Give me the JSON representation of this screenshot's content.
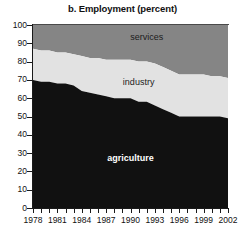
{
  "chart_data": {
    "type": "area",
    "title": "b. Employment (percent)",
    "xlabel": "",
    "ylabel": "",
    "ylim": [
      0,
      100
    ],
    "xlim": [
      1978,
      2002
    ],
    "grid": false,
    "legend_position": "inline-labels",
    "stacked": true,
    "y_ticks": [
      0,
      10,
      20,
      30,
      40,
      50,
      60,
      70,
      80,
      90,
      100
    ],
    "y_tick_labels": [
      "0",
      "10",
      "20",
      "30",
      "40",
      "50",
      "60",
      "70",
      "80",
      "90",
      "100"
    ],
    "x": [
      1978,
      1979,
      1980,
      1981,
      1982,
      1983,
      1984,
      1985,
      1986,
      1987,
      1988,
      1989,
      1990,
      1991,
      1992,
      1993,
      1994,
      1995,
      1996,
      1997,
      1998,
      1999,
      2000,
      2001,
      2002
    ],
    "x_tick_labels": [
      "1978",
      "1981",
      "1984",
      "1987",
      "1990",
      "1993",
      "1996",
      "1999",
      "2002"
    ],
    "x_tick_years": [
      1978,
      1981,
      1984,
      1987,
      1990,
      1993,
      1996,
      1999,
      2002
    ],
    "series": [
      {
        "name": "agriculture",
        "color": "#111111",
        "label_color": "#ffffff",
        "values": [
          70,
          69,
          69,
          68,
          68,
          67,
          64,
          63,
          62,
          61,
          60,
          60,
          60,
          58,
          58,
          56,
          54,
          52,
          50,
          50,
          50,
          50,
          50,
          50,
          49
        ]
      },
      {
        "name": "industry",
        "color": "#e2e2e2",
        "label_color": "#1c1c1c",
        "values": [
          17,
          17,
          17,
          17,
          17,
          17,
          19,
          19,
          20,
          20,
          21,
          21,
          21,
          22,
          22,
          23,
          23,
          23,
          23,
          23,
          23,
          23,
          22,
          22,
          22
        ]
      },
      {
        "name": "services",
        "color": "#858585",
        "label_color": "#1c1c1c",
        "values": [
          13,
          14,
          14,
          15,
          15,
          16,
          17,
          18,
          18,
          19,
          19,
          19,
          19,
          20,
          20,
          21,
          23,
          25,
          27,
          27,
          27,
          27,
          28,
          28,
          29
        ]
      }
    ],
    "cumulative_top_of_agriculture": [
      70,
      69,
      69,
      68,
      68,
      67,
      64,
      63,
      62,
      61,
      60,
      60,
      60,
      58,
      58,
      56,
      54,
      52,
      50,
      50,
      50,
      50,
      50,
      50,
      49
    ],
    "cumulative_top_of_industry": [
      87,
      86,
      86,
      85,
      85,
      84,
      83,
      82,
      82,
      81,
      81,
      81,
      81,
      80,
      80,
      79,
      77,
      75,
      73,
      73,
      73,
      73,
      72,
      72,
      71
    ],
    "annotations": [
      {
        "text": "services",
        "series": "services"
      },
      {
        "text": "industry",
        "series": "industry"
      },
      {
        "text": "agriculture",
        "series": "agriculture"
      }
    ]
  },
  "labels": {
    "services": "services",
    "industry": "industry",
    "agriculture": "agriculture"
  }
}
